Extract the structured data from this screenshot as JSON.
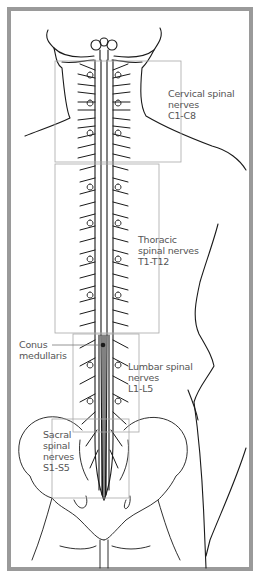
{
  "diagram": {
    "title": "Spinal nerves",
    "colors": {
      "frame": "#9a9a9a",
      "line": "#1a1a1a",
      "region_box": "#a8a8a8",
      "label_text": "#555555"
    },
    "regions": [
      {
        "id": "cervical",
        "lines": [
          "Cervical spinal",
          "nerves",
          "C1-C8"
        ],
        "box": [
          55,
          61,
          181,
          162
        ]
      },
      {
        "id": "thoracic",
        "lines": [
          "Thoracic",
          "spinal nerves",
          "T1-T12"
        ],
        "box": [
          55,
          164,
          159,
          333
        ]
      },
      {
        "id": "lumbar",
        "lines": [
          "Lumbar spinal",
          "nerves",
          "L1-L5"
        ],
        "box": [
          73,
          334,
          139,
          432
        ]
      },
      {
        "id": "sacral",
        "lines": [
          "Sacral",
          "spinal",
          "nerves",
          "S1-S5"
        ],
        "box": [
          52,
          419,
          129,
          498
        ]
      }
    ],
    "callouts": [
      {
        "id": "conus-medullaris",
        "lines": [
          "Conus",
          "medullaris"
        ]
      }
    ]
  }
}
